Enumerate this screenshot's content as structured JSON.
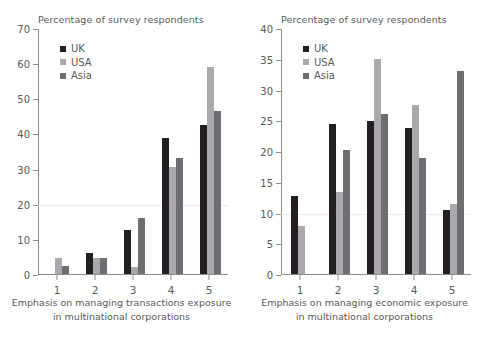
{
  "chart_data": [
    {
      "type": "bar",
      "title": "Percentage of survey respondents",
      "xlabel_line1": "Emphasis on managing transactions exposure",
      "xlabel_line2": "in multinational corporations",
      "ylabel": "",
      "categories": [
        "1",
        "2",
        "3",
        "4",
        "5"
      ],
      "yticks": [
        0,
        10,
        20,
        30,
        40,
        50,
        60,
        70
      ],
      "ylim": [
        0,
        70
      ],
      "grid": true,
      "legend_position": "top-left",
      "series": [
        {
          "name": "UK",
          "color": "#231f20",
          "values": [
            0,
            6.0,
            12.5,
            38.7,
            42.3
          ]
        },
        {
          "name": "USA",
          "color": "#a7a9ac",
          "values": [
            4.6,
            4.6,
            2.0,
            30.4,
            59.0
          ]
        },
        {
          "name": "Asia",
          "color": "#6d6e71",
          "values": [
            2.2,
            4.5,
            16.0,
            33.0,
            46.3
          ]
        }
      ]
    },
    {
      "type": "bar",
      "title": "Percentage of survey respondents",
      "xlabel_line1": "Emphasis on managing economic exposure",
      "xlabel_line2": "in multinational corporations",
      "ylabel": "",
      "categories": [
        "1",
        "2",
        "3",
        "4",
        "5"
      ],
      "yticks": [
        0,
        5,
        10,
        15,
        20,
        25,
        30,
        35,
        40
      ],
      "ylim": [
        0,
        40
      ],
      "grid": true,
      "legend_position": "top-left",
      "series": [
        {
          "name": "UK",
          "color": "#231f20",
          "values": [
            12.7,
            24.4,
            24.9,
            23.8,
            10.4
          ]
        },
        {
          "name": "USA",
          "color": "#a7a9ac",
          "values": [
            7.8,
            13.3,
            35.0,
            27.5,
            11.4
          ]
        },
        {
          "name": "Asia",
          "color": "#6d6e71",
          "values": [
            0,
            20.2,
            26.0,
            18.8,
            33.0
          ]
        }
      ]
    }
  ]
}
